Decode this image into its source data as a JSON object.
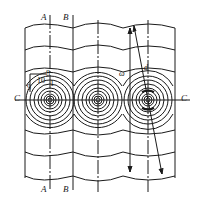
{
  "diagram": {
    "type": "wave-interference-pattern",
    "stroke_color": "#1a1a1a",
    "background": "#ffffff",
    "section_labels": {
      "A_top": "A",
      "B_top": "B",
      "A_bottom": "A",
      "B_bottom": "B",
      "C_left": "C",
      "C_right": "C"
    },
    "annotations": {
      "n8": "8",
      "n10": "10",
      "n1": "1",
      "n9": "9",
      "omega": "ω",
      "d": "d"
    },
    "sources": [
      {
        "cx": 58,
        "cy": 100
      },
      {
        "cx": 100,
        "cy": 100
      },
      {
        "cx": 148,
        "cy": 100
      }
    ],
    "ring_count": 9,
    "wavefront_rows_top": [
      22,
      50,
      72
    ],
    "wavefront_rows_bottom": [
      128,
      150,
      178
    ]
  }
}
